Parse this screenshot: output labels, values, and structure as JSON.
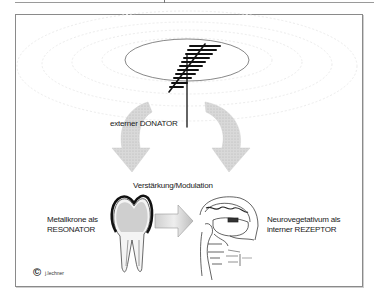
{
  "diagram": {
    "labels": {
      "donator": "externer DONATOR",
      "amplification": "Verstärkung/Modulation",
      "resonator_line1": "Metallkrone als",
      "resonator_line2": "RESONATOR",
      "receptor_line1": "Neurovegetativum als",
      "receptor_line2": "interner REZEPTOR"
    },
    "copyright": {
      "symbol": "©",
      "author": "j.lechner"
    },
    "icons": [
      "antenna-icon",
      "signal-ellipse",
      "curved-arrow-left",
      "curved-arrow-right",
      "tooth-with-crown-icon",
      "right-arrow-icon",
      "brain-section-icon"
    ],
    "colors": {
      "frame": "#8a8a8a",
      "arrow_fill": "#c8c8c8",
      "line": "#111111",
      "background": "#ffffff"
    }
  }
}
